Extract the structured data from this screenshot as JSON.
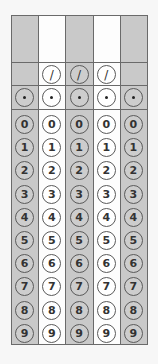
{
  "form": {
    "type": "grid-in answer sheet",
    "columns": [
      {
        "index": 1,
        "shaded": true,
        "has_slash": false,
        "entry_value": ""
      },
      {
        "index": 2,
        "shaded": false,
        "has_slash": true,
        "entry_value": ""
      },
      {
        "index": 3,
        "shaded": true,
        "has_slash": true,
        "entry_value": ""
      },
      {
        "index": 4,
        "shaded": false,
        "has_slash": true,
        "entry_value": ""
      },
      {
        "index": 5,
        "shaded": true,
        "has_slash": false,
        "entry_value": ""
      }
    ],
    "slash_symbol": "/",
    "decimal_symbol": "•",
    "digits": [
      "0",
      "1",
      "2",
      "3",
      "4",
      "5",
      "6",
      "7",
      "8",
      "9"
    ],
    "colors": {
      "shaded_column": "#c9c9c9",
      "plain_column": "#fdfdfd",
      "border": "#6a6a6a"
    }
  }
}
